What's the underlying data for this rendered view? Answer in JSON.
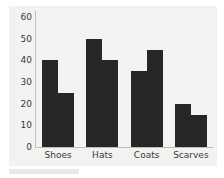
{
  "chart_data": {
    "type": "bar",
    "title": "",
    "subtitle": "",
    "xlabel": "",
    "ylabel": "",
    "categories": [
      "Shoes",
      "Hats",
      "Coats",
      "Scarves"
    ],
    "series": [
      {
        "name": "Series 1",
        "values": [
          40,
          50,
          35,
          20
        ]
      },
      {
        "name": "Series 2",
        "values": [
          25,
          40,
          45,
          15
        ]
      }
    ],
    "ylim": [
      0,
      60
    ],
    "yticks": [
      0,
      10,
      20,
      30,
      40,
      50,
      60
    ],
    "ytick_labels": [
      "0",
      "10",
      "20",
      "30",
      "40",
      "50",
      "60"
    ],
    "grid": false,
    "legend": false,
    "legend_position": "none",
    "annotations": [],
    "colors": {
      "bar": "#262626",
      "panel_background": "#f2f2f0",
      "figure_background": "#ffffff",
      "axis_line": "#bdbdbb",
      "tick_label": "#3a3a3a"
    }
  }
}
